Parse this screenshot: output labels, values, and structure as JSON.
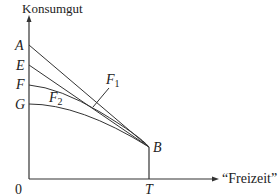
{
  "diagram": {
    "y_axis_label": "Konsumgut",
    "x_axis_label": "“Freizeit”",
    "origin_label": "0",
    "points": {
      "A": "A",
      "E": "E",
      "F": "F",
      "G": "G",
      "B": "B",
      "T": "T"
    },
    "curve_labels": {
      "F1": {
        "main": "F",
        "sub": "1"
      },
      "F2": {
        "main": "F",
        "sub": "2"
      }
    },
    "line_color": "#333333"
  }
}
